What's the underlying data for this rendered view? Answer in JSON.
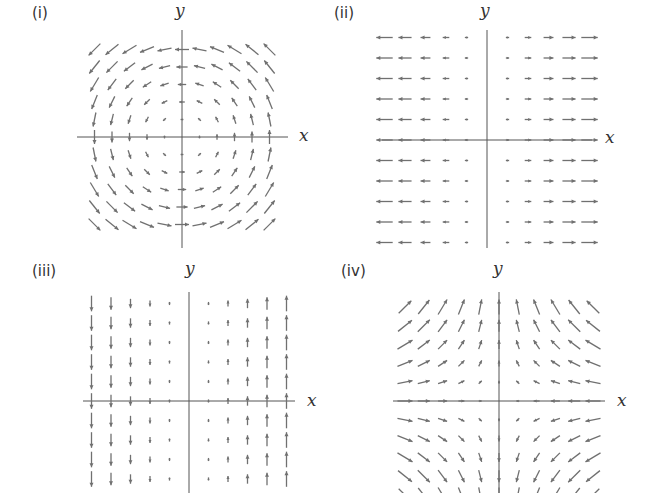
{
  "figure": {
    "panels": [
      {
        "id": "i",
        "label": "(i)",
        "x_label": "x",
        "y_label": "y",
        "field": "(-y, x)",
        "description": "counterclockwise rotation about origin"
      },
      {
        "id": "ii",
        "label": "(ii)",
        "x_label": "x",
        "y_label": "y",
        "field": "(x, 0)",
        "description": "horizontal arrows pointing away from y-axis"
      },
      {
        "id": "iii",
        "label": "(iii)",
        "x_label": "x",
        "y_label": "y",
        "field": "(0, x)",
        "description": "vertical arrows, up for x>0, down for x<0"
      },
      {
        "id": "iv",
        "label": "(iv)",
        "x_label": "x",
        "y_label": "y",
        "field": "(-x, y)",
        "description": "saddle: inward along x, outward along y"
      }
    ],
    "colors": {
      "arrow": "#707070",
      "axis": "#555555",
      "text": "#333333"
    }
  },
  "chart_data": [
    {
      "type": "quiver",
      "title": "(i)",
      "field": {
        "u": "-y",
        "v": "x"
      },
      "grid": {
        "x": [
          -5,
          -4,
          -3,
          -2,
          -1,
          0,
          1,
          2,
          3,
          4,
          5
        ],
        "y": [
          -5,
          -4,
          -3,
          -2,
          -1,
          0,
          1,
          2,
          3,
          4,
          5
        ]
      },
      "xlabel": "x",
      "ylabel": "y"
    },
    {
      "type": "quiver",
      "title": "(ii)",
      "field": {
        "u": "x",
        "v": "0"
      },
      "grid": {
        "x": [
          -5,
          -4,
          -3,
          -2,
          -1,
          0,
          1,
          2,
          3,
          4,
          5
        ],
        "y": [
          -5,
          -4,
          -3,
          -2,
          -1,
          0,
          1,
          2,
          3,
          4,
          5
        ]
      },
      "xlabel": "x",
      "ylabel": "y"
    },
    {
      "type": "quiver",
      "title": "(iii)",
      "field": {
        "u": "0",
        "v": "x"
      },
      "grid": {
        "x": [
          -5,
          -4,
          -3,
          -2,
          -1,
          0,
          1,
          2,
          3,
          4,
          5
        ],
        "y": [
          -5,
          -4,
          -3,
          -2,
          -1,
          0,
          1,
          2,
          3,
          4,
          5
        ]
      },
      "xlabel": "x",
      "ylabel": "y"
    },
    {
      "type": "quiver",
      "title": "(iv)",
      "field": {
        "u": "-x",
        "v": "y"
      },
      "grid": {
        "x": [
          -5,
          -4,
          -3,
          -2,
          -1,
          0,
          1,
          2,
          3,
          4,
          5
        ],
        "y": [
          -5,
          -4,
          -3,
          -2,
          -1,
          0,
          1,
          2,
          3,
          4,
          5
        ]
      },
      "xlabel": "x",
      "ylabel": "y"
    }
  ]
}
